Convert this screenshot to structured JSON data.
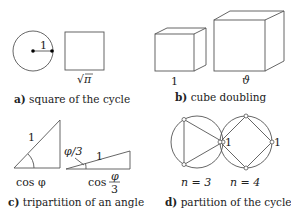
{
  "panels": {
    "a": {
      "caption_letter": "a)",
      "caption_text": " square of the cycle",
      "radius_label": "1",
      "side_label_root": "√",
      "side_label_arg": "π"
    },
    "b": {
      "caption_letter": "b)",
      "caption_text": " cube doubling",
      "small_label": "1",
      "large_label": "ϑ"
    },
    "c": {
      "caption_letter": "c)",
      "caption_text": " tripartition of an angle",
      "hyp_label_1": "1",
      "adj_label_1": "cos φ",
      "angle_label_2": "φ/3",
      "hyp_label_2": "1",
      "adj_label_2_prefix": "cos",
      "adj_label_2_num": "φ",
      "adj_label_2_den": "3"
    },
    "d": {
      "caption_letter": "d)",
      "caption_text": " partition of the cycle",
      "left_n": "n = 3",
      "right_n": "n = 4",
      "left_vertex_label": "1",
      "right_vertex_label": "1",
      "left_sides": 3,
      "right_sides": 4
    }
  }
}
